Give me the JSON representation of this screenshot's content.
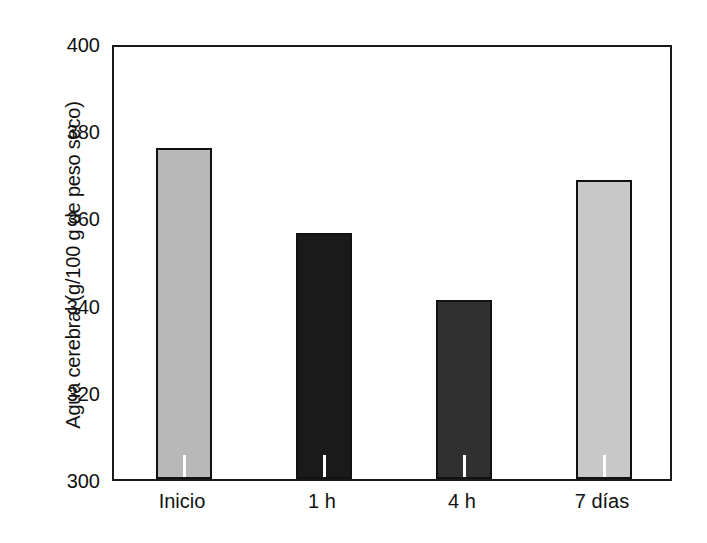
{
  "chart_data": {
    "type": "bar",
    "title": "",
    "xlabel": "",
    "ylabel": "Agua cerebral (g/100 g de peso seco)",
    "categories": [
      "Inicio",
      "1 h",
      "4 h",
      "7 días"
    ],
    "values": [
      376,
      356.5,
      341,
      368.5
    ],
    "ylim": [
      300,
      400
    ],
    "yticks": [
      300,
      320,
      340,
      360,
      380,
      400
    ],
    "ytick_labels": [
      "300",
      "320",
      "340",
      "360",
      "380",
      "400"
    ],
    "grid": false,
    "legend": "none",
    "bar_colors": [
      "#b8b8b8",
      "#1a1a1a",
      "#303030",
      "#c8c8c8"
    ],
    "bar_edge_color": "#111111",
    "axis_color": "#1a1a1a",
    "background_color": "#ffffff"
  }
}
